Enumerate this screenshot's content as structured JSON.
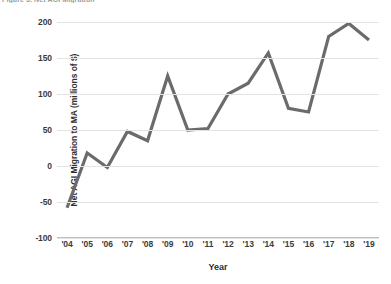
{
  "figure": {
    "caption": "Figure 3. Net AGI Migration"
  },
  "chart_data": {
    "type": "line",
    "title": "",
    "xlabel": "Year",
    "ylabel": "Net AGI Migration to MA (millions of $)",
    "categories": [
      "'04",
      "'05",
      "'06",
      "'07",
      "'08",
      "'09",
      "'10",
      "'11",
      "'12",
      "'13",
      "'14",
      "'15",
      "'16",
      "'17",
      "'18",
      "'19"
    ],
    "values": [
      -58,
      18,
      -2,
      48,
      35,
      125,
      50,
      52,
      100,
      115,
      157,
      80,
      75,
      180,
      198,
      175
    ],
    "series": [
      {
        "name": "Net AGI Migration to MA",
        "color": "#6b6b6b",
        "values": [
          -58,
          18,
          -2,
          48,
          35,
          125,
          50,
          52,
          100,
          115,
          157,
          80,
          75,
          180,
          198,
          175
        ]
      }
    ],
    "ylim": [
      -100,
      200
    ],
    "yticks": [
      200,
      150,
      100,
      50,
      0,
      -50,
      -100
    ],
    "ytick_labels": [
      "200",
      "150",
      "100",
      "50",
      "0",
      "-50",
      "-100"
    ],
    "grid": true,
    "legend": false,
    "legend_position": "none"
  }
}
